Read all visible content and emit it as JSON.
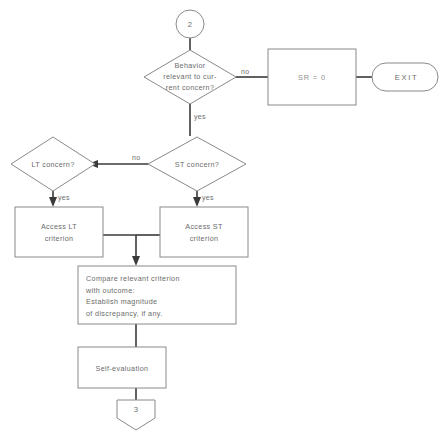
{
  "diagram": {
    "background_color": "#ffffff",
    "shape_stroke_color": "#8a8a8a",
    "connector_color": "#3a3a3a",
    "text_color": "#6b6b6b"
  },
  "nodes": {
    "entry_connector": {
      "shape": "circle",
      "label": "2"
    },
    "behavior_decision": {
      "shape": "diamond",
      "line1": "Behavior",
      "line2": "relevant to cur-",
      "line3": "rent concern?"
    },
    "sr_zero": {
      "shape": "process",
      "label": "SR = 0"
    },
    "exit_terminal": {
      "shape": "stadium",
      "label": "EXIT"
    },
    "lt_concern_decision": {
      "shape": "diamond",
      "label": "LT concern?"
    },
    "st_concern_decision": {
      "shape": "diamond",
      "label": "ST concern?"
    },
    "access_lt": {
      "shape": "process",
      "line1": "Access LT",
      "line2": "criterion"
    },
    "access_st": {
      "shape": "process",
      "line1": "Access ST",
      "line2": "criterion"
    },
    "compare_criterion": {
      "shape": "process",
      "line1": "Compare relevant criterion",
      "line2": "with outcome:",
      "line3": "Establish magnitude",
      "line4": "of discrepancy, if any."
    },
    "self_evaluation": {
      "shape": "process",
      "label": "Self-evaluation"
    },
    "exit_connector": {
      "shape": "pentagon-down",
      "label": "3"
    }
  },
  "edge_labels": {
    "behavior_no": "no",
    "behavior_yes": "yes",
    "st_no": "no",
    "st_yes": "yes",
    "lt_yes": "yes"
  }
}
